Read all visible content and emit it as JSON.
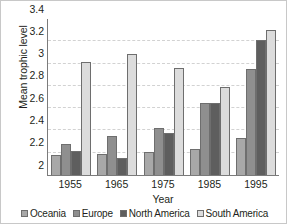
{
  "chart_data": {
    "type": "bar",
    "title": "",
    "subtitle": "",
    "xlabel": "Year",
    "ylabel": "Mean trophic level",
    "categories": [
      "1955",
      "1965",
      "1975",
      "1985",
      "1995"
    ],
    "series": [
      {
        "name": "Oceania",
        "color": "#a8a8a8",
        "values": [
          2.18,
          2.19,
          2.21,
          2.23,
          2.33
        ]
      },
      {
        "name": "Europe",
        "color": "#8f8f8f",
        "values": [
          2.28,
          2.35,
          2.42,
          2.65,
          2.95
        ]
      },
      {
        "name": "North America",
        "color": "#5e5e5e",
        "values": [
          2.22,
          2.15,
          2.38,
          2.65,
          3.21
        ]
      },
      {
        "name": "South America",
        "color": "#dcdcdc",
        "values": [
          3.01,
          3.09,
          2.96,
          2.79,
          3.3
        ]
      }
    ],
    "ylim": [
      2,
      3.4
    ],
    "yticks": [
      "2",
      "2.2",
      "2.4",
      "2.6",
      "2.8",
      "3",
      "3.2",
      "3.4"
    ],
    "ytick_values": [
      2,
      2.2,
      2.4,
      2.6,
      2.8,
      3,
      3.2,
      3.4
    ],
    "grid": true,
    "grid_axis": "y",
    "legend_position": "bottom",
    "axis_color": "#7b7b7b",
    "grid_color": "#d2d2d2",
    "text_color": "#231f20",
    "background": "#ffffff"
  }
}
